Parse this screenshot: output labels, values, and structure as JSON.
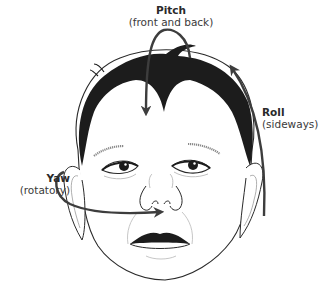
{
  "diagram": {
    "labels": {
      "pitch": {
        "title": "Pitch",
        "subtitle": "(front and back)"
      },
      "roll": {
        "title": "Roll",
        "subtitle": "(sideways)"
      },
      "yaw": {
        "title": "Yaw",
        "subtitle": "(rotatory)"
      }
    },
    "colors": {
      "hair": "#1c1c1c",
      "arrow": "#3d3d3d",
      "outline": "#2a2a2a",
      "light_line": "#9a9a9a",
      "background": "#ffffff"
    },
    "arrows": [
      {
        "name": "pitch-arrow",
        "direction": "over top of head, pointing down onto forehead"
      },
      {
        "name": "roll-arrow",
        "direction": "right side, curving upward"
      },
      {
        "name": "yaw-arrow",
        "direction": "from left ear around to nose"
      }
    ]
  }
}
